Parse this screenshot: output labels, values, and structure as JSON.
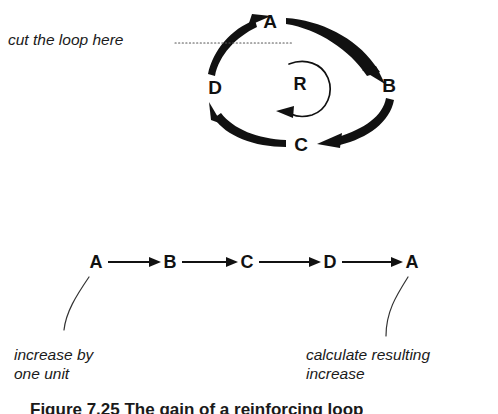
{
  "figure": {
    "caption": "Figure 7.25   The gain of a reinforcing loop",
    "background_color": "#ffffff",
    "ink_color": "#111111"
  },
  "loop_diagram": {
    "name": "causal-loop",
    "direction": "clockwise",
    "loop_symbol": "R",
    "nodes": [
      {
        "id": "A",
        "label": "A",
        "x": 270,
        "y": 22
      },
      {
        "id": "B",
        "label": "B",
        "x": 389,
        "y": 86
      },
      {
        "id": "C",
        "label": "C",
        "x": 301,
        "y": 145
      },
      {
        "id": "D",
        "label": "D",
        "x": 215,
        "y": 88
      }
    ],
    "edges": [
      {
        "from": "A",
        "to": "B"
      },
      {
        "from": "B",
        "to": "C"
      },
      {
        "from": "C",
        "to": "D"
      },
      {
        "from": "D",
        "to": "A"
      }
    ],
    "cut_annotation": {
      "text": "cut the loop here",
      "leader_style": "dotted",
      "leader_from_x": 175,
      "leader_to_x": 292,
      "leader_y": 43
    }
  },
  "chain_diagram": {
    "name": "unrolled-chain",
    "nodes": [
      {
        "id": "A1",
        "label": "A",
        "x": 96,
        "y": 262
      },
      {
        "id": "B1",
        "label": "B",
        "x": 170,
        "y": 262
      },
      {
        "id": "C1",
        "label": "C",
        "x": 247,
        "y": 262
      },
      {
        "id": "D1",
        "label": "D",
        "x": 330,
        "y": 262
      },
      {
        "id": "A2",
        "label": "A",
        "x": 412,
        "y": 262
      }
    ],
    "edges": [
      {
        "from": "A1",
        "to": "B1"
      },
      {
        "from": "B1",
        "to": "C1"
      },
      {
        "from": "C1",
        "to": "D1"
      },
      {
        "from": "D1",
        "to": "A2"
      }
    ],
    "annotations": [
      {
        "id": "left",
        "text": "increase by\none unit",
        "attaches_to": "A1"
      },
      {
        "id": "right",
        "text": "calculate resulting\nincrease",
        "attaches_to": "A2"
      }
    ]
  }
}
